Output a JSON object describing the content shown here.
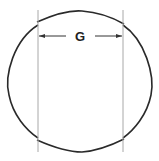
{
  "diagram": {
    "dimension_label": "G",
    "colors": {
      "outline": "#2a2a2a",
      "guide_lines": "#a8a8a8",
      "arrows": "#333333",
      "background": "#ffffff"
    },
    "shape": "circle with flattened top and bottom between two vertical guide lines",
    "guides": {
      "left_x": 38,
      "right_x": 123
    }
  }
}
